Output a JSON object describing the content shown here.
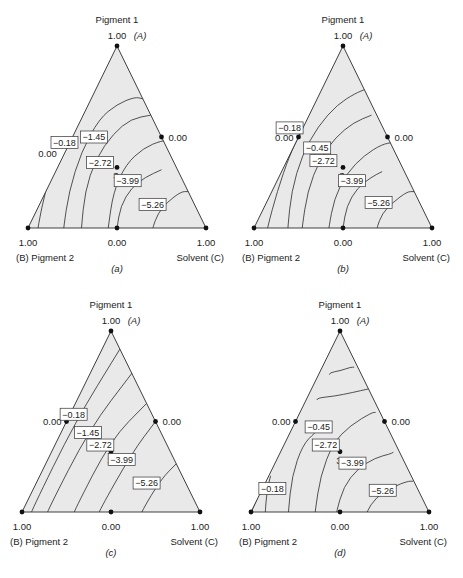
{
  "chart_data": [
    {
      "type": "ternary-contour",
      "panel_label": "(a)",
      "vertices": {
        "top": {
          "name": "Pigment 1",
          "symbol": "(A)",
          "value": "1.00"
        },
        "left": {
          "name": "(B) Pigment 2",
          "value": "1.00"
        },
        "right": {
          "name": "Solvent (C)",
          "value": "1.00"
        }
      },
      "edge_midpoint_labels": {
        "base": "0.00",
        "right": "0.00",
        "left": "0.00"
      },
      "design_point": {
        "label": "3",
        "u": 0.5,
        "v": 0.333
      },
      "show_left_mid_point": false,
      "contours": [
        {
          "points": [
            [
              0.0,
              0.02
            ],
            [
              0.1,
              0.07
            ],
            [
              0.2,
              0.03
            ]
          ],
          "hidden": true
        },
        {
          "points": [
            [
              0.055,
              0.0
            ],
            [
              0.1,
              0.22
            ],
            [
              0.17,
              0.42
            ],
            [
              0.245,
              0.56
            ]
          ]
        },
        {
          "points": [
            [
              0.2,
              0.0
            ],
            [
              0.23,
              0.2
            ],
            [
              0.3,
              0.42
            ],
            [
              0.4,
              0.6
            ],
            [
              0.5,
              0.68
            ],
            [
              0.6,
              0.72
            ],
            [
              0.645,
              0.71
            ]
          ]
        },
        {
          "points": [
            [
              0.3,
              0.0
            ],
            [
              0.32,
              0.2
            ],
            [
              0.38,
              0.38
            ],
            [
              0.48,
              0.52
            ],
            [
              0.58,
              0.6
            ],
            [
              0.69,
              0.62
            ]
          ]
        },
        {
          "points": [
            [
              0.45,
              0.0
            ],
            [
              0.48,
              0.2
            ],
            [
              0.55,
              0.35
            ],
            [
              0.65,
              0.44
            ],
            [
              0.75,
              0.48
            ],
            [
              0.8,
              0.48
            ]
          ]
        },
        {
          "points": [
            [
              0.5,
              0.0
            ],
            [
              0.52,
              0.12
            ],
            [
              0.58,
              0.22
            ],
            [
              0.66,
              0.28
            ],
            [
              0.75,
              0.32
            ]
          ]
        },
        {
          "points": [
            [
              0.7,
              0.0
            ],
            [
              0.73,
              0.08
            ],
            [
              0.78,
              0.14
            ],
            [
              0.86,
              0.2
            ],
            [
              0.9,
              0.2
            ]
          ]
        }
      ],
      "labels": [
        {
          "text": "−0.18",
          "u": 0.205,
          "v": 0.47,
          "anchor_dot": false
        },
        {
          "text": "−1.45",
          "u": 0.37,
          "v": 0.5
        },
        {
          "text": "−2.72",
          "u": 0.405,
          "v": 0.36
        },
        {
          "text": "−3.99",
          "u": 0.56,
          "v": 0.26
        },
        {
          "text": "−5.26",
          "u": 0.7,
          "v": 0.13
        }
      ],
      "free_text": [
        {
          "text": "0.00",
          "u": 0.11,
          "v": 0.39
        }
      ]
    },
    {
      "type": "ternary-contour",
      "panel_label": "(b)",
      "vertices": {
        "top": {
          "name": "Pigment 1",
          "symbol": "(A)",
          "value": "1.00"
        },
        "left": {
          "name": "(B) Pigment 2",
          "value": "1.00"
        },
        "right": {
          "name": "Solvent (C)",
          "value": "1.00"
        }
      },
      "edge_midpoint_labels": {
        "base": "0.00",
        "right": "0.00",
        "left": "0.00"
      },
      "design_point": {
        "label": "3",
        "u": 0.5,
        "v": 0.333
      },
      "show_left_mid_point": true,
      "contours": [
        {
          "points": [
            [
              0.075,
              0.0
            ],
            [
              0.13,
              0.2
            ],
            [
              0.2,
              0.4
            ],
            [
              0.26,
              0.52
            ]
          ]
        },
        {
          "points": [
            [
              0.19,
              0.0
            ],
            [
              0.21,
              0.2
            ],
            [
              0.27,
              0.4
            ],
            [
              0.36,
              0.56
            ],
            [
              0.47,
              0.68
            ],
            [
              0.57,
              0.74
            ],
            [
              0.62,
              0.76
            ]
          ]
        },
        {
          "points": [
            [
              0.27,
              0.0
            ],
            [
              0.3,
              0.2
            ],
            [
              0.37,
              0.38
            ],
            [
              0.46,
              0.5
            ],
            [
              0.56,
              0.58
            ],
            [
              0.66,
              0.62
            ]
          ]
        },
        {
          "points": [
            [
              0.42,
              0.0
            ],
            [
              0.45,
              0.16
            ],
            [
              0.52,
              0.3
            ],
            [
              0.62,
              0.4
            ],
            [
              0.72,
              0.46
            ],
            [
              0.78,
              0.47
            ]
          ]
        },
        {
          "points": [
            [
              0.5,
              0.0
            ],
            [
              0.52,
              0.12
            ],
            [
              0.58,
              0.22
            ],
            [
              0.66,
              0.28
            ],
            [
              0.72,
              0.31
            ]
          ]
        },
        {
          "points": [
            [
              0.69,
              0.0
            ],
            [
              0.72,
              0.08
            ],
            [
              0.78,
              0.14
            ],
            [
              0.86,
              0.2
            ],
            [
              0.9,
              0.2
            ]
          ]
        }
      ],
      "labels": [
        {
          "text": "−0.18",
          "u": 0.2,
          "v": 0.55
        },
        {
          "text": "−0.45",
          "u": 0.355,
          "v": 0.44
        },
        {
          "text": "−2.72",
          "u": 0.39,
          "v": 0.37
        },
        {
          "text": "−3.99",
          "u": 0.55,
          "v": 0.26
        },
        {
          "text": "−5.26",
          "u": 0.7,
          "v": 0.14
        }
      ],
      "free_text": []
    },
    {
      "type": "ternary-contour",
      "panel_label": "(c)",
      "vertices": {
        "top": {
          "name": "Pigment 1",
          "symbol": "(A)",
          "value": "1.00"
        },
        "left": {
          "name": "(B) Pigment 2",
          "value": "1.00"
        },
        "right": {
          "name": "Solvent (C)",
          "value": "1.00"
        }
      },
      "edge_midpoint_labels": {
        "base": "0.00",
        "right": "0.00",
        "left": "0.00"
      },
      "design_point": {
        "label": "3",
        "u": 0.5,
        "v": 0.333
      },
      "show_left_mid_point": true,
      "contours": [
        {
          "points": [
            [
              0.05,
              0.0
            ],
            [
              0.3,
              0.5
            ],
            [
              0.55,
              0.9
            ]
          ]
        },
        {
          "points": [
            [
              0.14,
              0.0
            ],
            [
              0.38,
              0.46
            ],
            [
              0.62,
              0.77
            ]
          ]
        },
        {
          "points": [
            [
              0.29,
              0.0
            ],
            [
              0.5,
              0.4
            ],
            [
              0.7,
              0.6
            ]
          ]
        },
        {
          "points": [
            [
              0.43,
              0.0
            ],
            [
              0.62,
              0.33
            ],
            [
              0.75,
              0.5
            ]
          ]
        },
        {
          "points": [
            [
              0.67,
              0.0
            ],
            [
              0.78,
              0.18
            ],
            [
              0.87,
              0.27
            ]
          ]
        }
      ],
      "labels": [
        {
          "text": "−0.18",
          "u": 0.29,
          "v": 0.54
        },
        {
          "text": "−1.45",
          "u": 0.37,
          "v": 0.44
        },
        {
          "text": "−2.72",
          "u": 0.44,
          "v": 0.37
        },
        {
          "text": "−3.99",
          "u": 0.56,
          "v": 0.29
        },
        {
          "text": "−5.26",
          "u": 0.7,
          "v": 0.16
        }
      ],
      "free_text": []
    },
    {
      "type": "ternary-contour",
      "panel_label": "(d)",
      "vertices": {
        "top": {
          "name": "Pigment 1",
          "symbol": "(A)",
          "value": "1.00"
        },
        "left": {
          "name": "(B) Pigment 2",
          "value": "1.00"
        },
        "right": {
          "name": "Solvent (C)",
          "value": "1.00"
        }
      },
      "edge_midpoint_labels": {
        "base": "0.00",
        "right": "0.00",
        "left": "0.00"
      },
      "design_point": {
        "label": "3",
        "u": 0.5,
        "v": 0.333
      },
      "show_left_mid_point": true,
      "contours": [
        {
          "points": [
            [
              0.0,
              0.0
            ],
            [
              0.03,
              0.06
            ],
            [
              0.05,
              0.12
            ]
          ]
        },
        {
          "points": [
            [
              0.08,
              0.0
            ],
            [
              0.09,
              0.12
            ],
            [
              0.11,
              0.2
            ]
          ]
        },
        {
          "points": [
            [
              0.21,
              0.0
            ],
            [
              0.23,
              0.2
            ],
            [
              0.29,
              0.37
            ],
            [
              0.36,
              0.44
            ],
            [
              0.39,
              0.46
            ]
          ]
        },
        {
          "points": [
            [
              0.36,
              0.0
            ],
            [
              0.39,
              0.2
            ],
            [
              0.46,
              0.38
            ],
            [
              0.56,
              0.48
            ],
            [
              0.68,
              0.55
            ],
            [
              0.7,
              0.55
            ]
          ]
        },
        {
          "points": [
            [
              0.48,
              0.0
            ],
            [
              0.52,
              0.14
            ],
            [
              0.6,
              0.24
            ],
            [
              0.7,
              0.3
            ],
            [
              0.78,
              0.32
            ],
            [
              0.8,
              0.33
            ]
          ]
        },
        {
          "points": [
            [
              0.65,
              0.0
            ],
            [
              0.7,
              0.08
            ],
            [
              0.8,
              0.14
            ],
            [
              0.88,
              0.17
            ],
            [
              0.91,
              0.17
            ]
          ]
        },
        {
          "points": [
            [
              0.44,
              0.77
            ],
            [
              0.5,
              0.78
            ],
            [
              0.56,
              0.8
            ],
            [
              0.58,
              0.8
            ]
          ]
        },
        {
          "points": [
            [
              0.37,
              0.63
            ],
            [
              0.47,
              0.64
            ],
            [
              0.57,
              0.66
            ],
            [
              0.66,
              0.68
            ]
          ]
        }
      ],
      "labels": [
        {
          "text": "−0.45",
          "u": 0.38,
          "v": 0.47
        },
        {
          "text": "−2.72",
          "u": 0.42,
          "v": 0.37
        },
        {
          "text": "−3.99",
          "u": 0.57,
          "v": 0.27
        },
        {
          "text": "−5.26",
          "u": 0.74,
          "v": 0.12
        },
        {
          "text": "−0.18",
          "u": 0.12,
          "v": 0.13
        }
      ],
      "free_text": []
    }
  ]
}
